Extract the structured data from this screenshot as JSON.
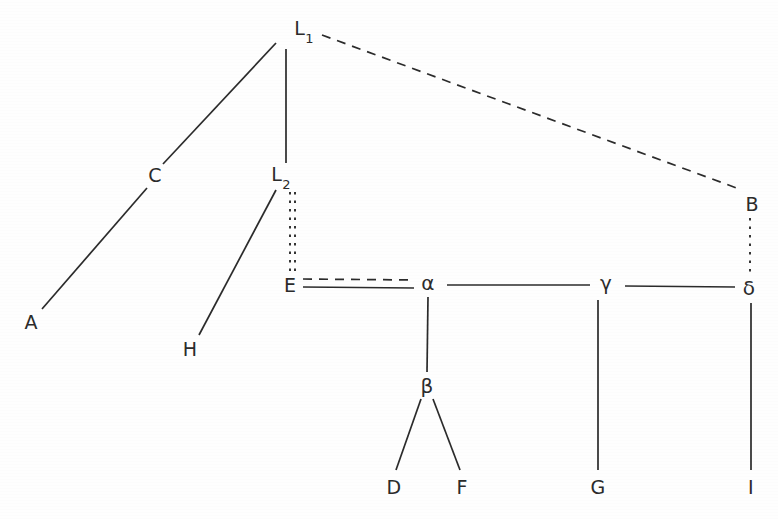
{
  "diagram": {
    "background_color": "#fefefe",
    "ink_color": "#2b2b2b",
    "width": 778,
    "height": 519,
    "nodes": [
      {
        "id": "L1",
        "label": "L",
        "sublabel": "1",
        "x": 304,
        "y": 30
      },
      {
        "id": "C",
        "label": "C",
        "sublabel": "",
        "x": 155,
        "y": 175
      },
      {
        "id": "L2",
        "label": "L",
        "sublabel": "2",
        "x": 281,
        "y": 176
      },
      {
        "id": "B",
        "label": "B",
        "sublabel": "",
        "x": 752,
        "y": 204
      },
      {
        "id": "E",
        "label": "E",
        "sublabel": "",
        "x": 290,
        "y": 285
      },
      {
        "id": "alpha",
        "label": "α",
        "sublabel": "",
        "x": 428,
        "y": 283
      },
      {
        "id": "gamma",
        "label": "γ",
        "sublabel": "",
        "x": 606,
        "y": 283
      },
      {
        "id": "delta",
        "label": "δ",
        "sublabel": "",
        "x": 749,
        "y": 288
      },
      {
        "id": "A",
        "label": "A",
        "sublabel": "",
        "x": 31,
        "y": 322
      },
      {
        "id": "H",
        "label": "H",
        "sublabel": "",
        "x": 190,
        "y": 349
      },
      {
        "id": "beta",
        "label": "β",
        "sublabel": "",
        "x": 427,
        "y": 386
      },
      {
        "id": "D",
        "label": "D",
        "sublabel": "",
        "x": 394,
        "y": 487
      },
      {
        "id": "F",
        "label": "F",
        "sublabel": "",
        "x": 462,
        "y": 487
      },
      {
        "id": "G",
        "label": "G",
        "sublabel": "",
        "x": 598,
        "y": 487
      },
      {
        "id": "I",
        "label": "I",
        "sublabel": "",
        "x": 751,
        "y": 487
      }
    ],
    "edges": [
      {
        "id": "A-C",
        "from": "A",
        "to": "C",
        "style": "solid",
        "x1": 42,
        "y1": 309,
        "x2": 147,
        "y2": 188
      },
      {
        "id": "C-L1",
        "from": "C",
        "to": "L1",
        "style": "solid",
        "x1": 163,
        "y1": 164,
        "x2": 276,
        "y2": 43
      },
      {
        "id": "L2-L1",
        "from": "L2",
        "to": "L1",
        "style": "solid",
        "x1": 286,
        "y1": 163,
        "x2": 286,
        "y2": 49
      },
      {
        "id": "L1-B",
        "from": "L1",
        "to": "B",
        "style": "dashed",
        "x1": 322,
        "y1": 35,
        "x2": 742,
        "y2": 190
      },
      {
        "id": "H-L2",
        "from": "H",
        "to": "L2",
        "style": "solid",
        "x1": 199,
        "y1": 335,
        "x2": 276,
        "y2": 190
      },
      {
        "id": "L2-E-a",
        "from": "L2",
        "to": "E",
        "style": "dotted",
        "x1": 290,
        "y1": 192,
        "x2": 290,
        "y2": 273
      },
      {
        "id": "L2-E-b",
        "from": "L2",
        "to": "E",
        "style": "dotted",
        "x1": 295,
        "y1": 192,
        "x2": 295,
        "y2": 273
      },
      {
        "id": "B-delta",
        "from": "B",
        "to": "delta",
        "style": "dotted",
        "x1": 750,
        "y1": 218,
        "x2": 750,
        "y2": 275
      },
      {
        "id": "E-alpha-d",
        "from": "E",
        "to": "alpha",
        "style": "dashed",
        "x1": 303,
        "y1": 279,
        "x2": 414,
        "y2": 280
      },
      {
        "id": "E-alpha-s",
        "from": "E",
        "to": "alpha",
        "style": "solid",
        "x1": 303,
        "y1": 287,
        "x2": 414,
        "y2": 288
      },
      {
        "id": "alpha-gamma",
        "from": "alpha",
        "to": "gamma",
        "style": "solid",
        "x1": 447,
        "y1": 285,
        "x2": 590,
        "y2": 285
      },
      {
        "id": "gamma-delta",
        "from": "gamma",
        "to": "delta",
        "style": "solid",
        "x1": 625,
        "y1": 286,
        "x2": 735,
        "y2": 287
      },
      {
        "id": "alpha-beta",
        "from": "alpha",
        "to": "beta",
        "style": "solid",
        "x1": 428,
        "y1": 297,
        "x2": 427,
        "y2": 372
      },
      {
        "id": "beta-D",
        "from": "beta",
        "to": "D",
        "style": "solid",
        "x1": 421,
        "y1": 399,
        "x2": 396,
        "y2": 470
      },
      {
        "id": "beta-F",
        "from": "beta",
        "to": "F",
        "style": "solid",
        "x1": 433,
        "y1": 399,
        "x2": 460,
        "y2": 470
      },
      {
        "id": "gamma-G",
        "from": "gamma",
        "to": "G",
        "style": "solid",
        "x1": 598,
        "y1": 300,
        "x2": 598,
        "y2": 470
      },
      {
        "id": "delta-I",
        "from": "delta",
        "to": "I",
        "style": "solid",
        "x1": 751,
        "y1": 303,
        "x2": 751,
        "y2": 470
      }
    ]
  }
}
